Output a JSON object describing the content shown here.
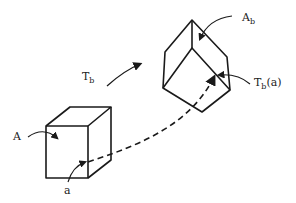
{
  "diagram": {
    "labels": {
      "transform": "T",
      "transform_sub": "b",
      "cube_a": "A",
      "point_a": "a",
      "cube_ab": "A",
      "cube_ab_sub": "b",
      "image_point": "T",
      "image_point_sub": "b",
      "image_point_arg": "(a)"
    },
    "colors": {
      "stroke": "#1a1a1a",
      "background": "#ffffff"
    }
  }
}
